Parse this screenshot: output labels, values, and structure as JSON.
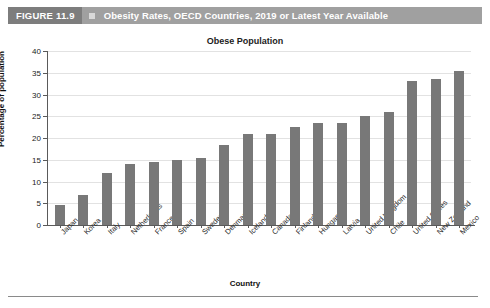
{
  "figure_header": {
    "figure_number": "FIGURE 11.9",
    "marker_icon": "square-marker-icon",
    "title": "Obesity Rates, OECD Countries, 2019 or Latest Year Available",
    "bar_color": "#a0a0a0",
    "number_box_color": "#7d7d7d",
    "text_color": "#ffffff"
  },
  "chart_data": {
    "type": "bar",
    "title": "Obese Population",
    "xlabel": "Country",
    "ylabel": "Percentage of population",
    "ylim": [
      0,
      40
    ],
    "ytick_step": 5,
    "yticks": [
      "0",
      "5",
      "10",
      "15",
      "20",
      "25",
      "30",
      "35",
      "40"
    ],
    "grid": true,
    "legend": "none",
    "bar_color": "#787878",
    "categories": [
      "Japan",
      "Korea",
      "Italy",
      "Netherlands",
      "France",
      "Spain",
      "Sweden",
      "Denmark",
      "Iceland",
      "Canada",
      "Finland",
      "Hungary",
      "Latvia",
      "United Kingdom",
      "Chile",
      "United States",
      "New Zealand",
      "Mexico"
    ],
    "values": [
      4.5,
      6.8,
      12.0,
      14.0,
      14.5,
      15.0,
      15.5,
      18.5,
      21.0,
      21.0,
      22.5,
      23.5,
      23.5,
      25.0,
      26.0,
      33.0,
      33.5,
      35.5
    ]
  }
}
